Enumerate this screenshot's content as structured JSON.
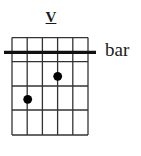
{
  "diagram": {
    "type": "guitar-chord-diagram",
    "position_label": "V",
    "barre_label": "bar",
    "strings": 6,
    "frets_shown": 4,
    "barre": {
      "from_string": 1,
      "to_string": 6,
      "position": "above first fret line"
    },
    "dots": [
      {
        "string": 4,
        "fret": 1
      },
      {
        "string": 2,
        "fret": 2
      }
    ],
    "colors": {
      "line": "#333333",
      "barre": "#111111",
      "dot": "#000000",
      "background": "#ffffff"
    }
  }
}
